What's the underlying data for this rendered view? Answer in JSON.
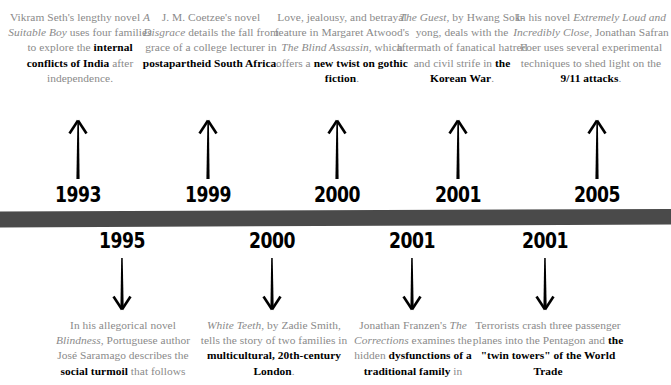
{
  "meta": {
    "kind": "timeline-infographic",
    "bar_color": "#4a4a4a",
    "body_text_color": "#8a8a8a",
    "emphasis_color": "#000000",
    "background": "#ffffff"
  },
  "timeline": {
    "bar_name": "timeline-bar"
  },
  "top_entries": [
    {
      "year": "1993",
      "arrow": "arrow-up-icon",
      "x": 78,
      "text_left": 6,
      "text_width": 148,
      "segments": [
        {
          "t": "Vikram Seth's lengthy novel ",
          "style": "normal"
        },
        {
          "t": "A Suitable Boy",
          "style": "italic"
        },
        {
          "t": " uses four families to explore the ",
          "style": "normal"
        },
        {
          "t": "internal conflicts of India",
          "style": "bold"
        },
        {
          "t": " after independence.",
          "style": "normal"
        }
      ]
    },
    {
      "year": "1999",
      "arrow": "arrow-up-icon",
      "x": 208,
      "text_left": 140,
      "text_width": 142,
      "segments": [
        {
          "t": "J. M. Coetzee's novel ",
          "style": "normal"
        },
        {
          "t": "Disgrace",
          "style": "italic"
        },
        {
          "t": " details the fall from grace of a college lecturer in ",
          "style": "normal"
        },
        {
          "t": "postapartheid South Africa",
          "style": "bold"
        },
        {
          "t": ".",
          "style": "normal"
        }
      ]
    },
    {
      "year": "2000",
      "arrow": "arrow-up-icon",
      "x": 337,
      "text_left": 272,
      "text_width": 140,
      "segments": [
        {
          "t": "Love, jealousy, and betrayal feature in Margaret Atwood's ",
          "style": "normal"
        },
        {
          "t": "The Blind Assassin",
          "style": "italic"
        },
        {
          "t": ", which offers a ",
          "style": "normal"
        },
        {
          "t": "new twist on gothic fiction",
          "style": "bold"
        },
        {
          "t": ".",
          "style": "normal"
        }
      ]
    },
    {
      "year": "2001",
      "arrow": "arrow-up-icon",
      "x": 458,
      "text_left": 396,
      "text_width": 132,
      "segments": [
        {
          "t": "The Guest",
          "style": "italic"
        },
        {
          "t": ", by Hwang Sok-yong, deals with the aftermath of fanatical hatred and civil strife in ",
          "style": "normal"
        },
        {
          "t": "the Korean War",
          "style": "bold"
        },
        {
          "t": ".",
          "style": "normal"
        }
      ]
    },
    {
      "year": "2005",
      "arrow": "arrow-up-icon",
      "x": 597,
      "text_left": 513,
      "text_width": 156,
      "segments": [
        {
          "t": "In his novel ",
          "style": "normal"
        },
        {
          "t": "Extremely Loud and Incredibly Close",
          "style": "italic"
        },
        {
          "t": ", Jonathan Safran Foer uses several experimental techniques to shed light on the ",
          "style": "normal"
        },
        {
          "t": "9/11 attacks",
          "style": "bold"
        },
        {
          "t": ".",
          "style": "normal"
        }
      ]
    }
  ],
  "bottom_entries": [
    {
      "year": "1995",
      "arrow": "arrow-down-icon",
      "x": 122,
      "text_left": 45,
      "text_width": 156,
      "segments": [
        {
          "t": "In his allegorical novel ",
          "style": "normal"
        },
        {
          "t": "Blindness",
          "style": "italic"
        },
        {
          "t": ", Portuguese author José Saramago describes the ",
          "style": "normal"
        },
        {
          "t": "social turmoil",
          "style": "bold"
        },
        {
          "t": " that follows",
          "style": "normal"
        }
      ]
    },
    {
      "year": "2000",
      "arrow": "arrow-down-icon",
      "x": 272,
      "text_left": 198,
      "text_width": 152,
      "segments": [
        {
          "t": "White Teeth",
          "style": "italic"
        },
        {
          "t": ", by Zadie Smith, tells the story of two families in ",
          "style": "normal"
        },
        {
          "t": "multicultural, 20th-century London",
          "style": "bold"
        },
        {
          "t": ".",
          "style": "normal"
        }
      ]
    },
    {
      "year": "2001",
      "arrow": "arrow-down-icon",
      "x": 412,
      "text_left": 337,
      "text_width": 152,
      "segments": [
        {
          "t": "Jonathan Franzen's ",
          "style": "normal"
        },
        {
          "t": "The Corrections",
          "style": "italic"
        },
        {
          "t": " examines the hidden ",
          "style": "normal"
        },
        {
          "t": "dysfunctions of a traditional family",
          "style": "bold"
        },
        {
          "t": " in",
          "style": "normal"
        }
      ]
    },
    {
      "year": "2001",
      "arrow": "arrow-down-icon",
      "x": 545,
      "text_left": 472,
      "text_width": 152,
      "segments": [
        {
          "t": "Terrorists crash three passenger planes into the Pentagon and ",
          "style": "normal"
        },
        {
          "t": "the \"twin towers\" of the World Trade",
          "style": "bold"
        }
      ]
    }
  ]
}
